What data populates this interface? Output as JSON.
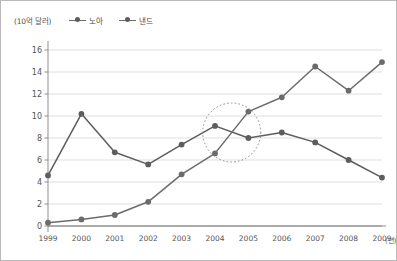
{
  "header": {
    "unit_label": "(10억 달러)"
  },
  "legend": {
    "position": "top-left",
    "entries": [
      {
        "label": "노아",
        "icon": "line-marker-icon",
        "color": "#5d5d5d"
      },
      {
        "label": "낸드",
        "icon": "line-marker-icon",
        "color": "#6b6b6b"
      }
    ]
  },
  "axes": {
    "x_unit": "(년)",
    "y_ticks": [
      "0",
      "2",
      "4",
      "6",
      "8",
      "10",
      "12",
      "14",
      "16"
    ],
    "x_ticks": [
      "1999",
      "2000",
      "2001",
      "2002",
      "2003",
      "2004",
      "2005",
      "2006",
      "2007",
      "2008",
      "2009"
    ]
  },
  "annotation": {
    "highlight_shape": "dotted-ellipse",
    "highlight_note": "crossover 2004-2005"
  },
  "chart_data": {
    "type": "line",
    "title": "",
    "subtitle": "",
    "xlabel": "(년)",
    "ylabel": "(10억 달러)",
    "categories": [
      "1999",
      "2000",
      "2001",
      "2002",
      "2003",
      "2004",
      "2005",
      "2006",
      "2007",
      "2008",
      "2009"
    ],
    "series": [
      {
        "name": "노아",
        "values": [
          4.6,
          10.2,
          6.7,
          5.6,
          7.4,
          9.1,
          8.0,
          8.5,
          7.6,
          6.0,
          4.4
        ],
        "color": "#5d5d5d"
      },
      {
        "name": "낸드",
        "values": [
          0.3,
          0.6,
          1.0,
          2.2,
          4.7,
          6.6,
          10.4,
          11.7,
          14.5,
          12.3,
          14.9
        ],
        "color": "#6b6b6b"
      }
    ],
    "ylim": [
      0,
      16
    ],
    "ystep": 2,
    "grid": "horizontal",
    "legend_position": "top-left",
    "annotations": [
      {
        "type": "ellipse",
        "style": "dotted",
        "around": [
          "2004",
          "2005"
        ],
        "note": "crossover region"
      }
    ]
  }
}
